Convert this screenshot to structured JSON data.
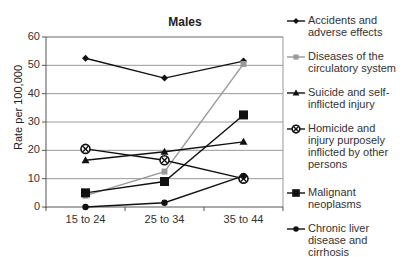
{
  "chart_data": {
    "type": "line",
    "title": "Males",
    "xlabel": "",
    "ylabel": "Rate per 100,000",
    "ylim": [
      0,
      60
    ],
    "yticks": [
      0,
      10,
      20,
      30,
      40,
      50,
      60
    ],
    "grid": true,
    "legend_position": "right",
    "categories": [
      "15 to 24",
      "25 to 34",
      "35 to 44"
    ],
    "series": [
      {
        "name": "Accidents and adverse effects",
        "lines": [
          "Accidents and",
          "adverse effects"
        ],
        "values": [
          52.5,
          45.5,
          51.5
        ],
        "color": "#111111",
        "marker": "diamond"
      },
      {
        "name": "Diseases of the circulatory system",
        "lines": [
          "Diseases of the",
          "circulatory system"
        ],
        "values": [
          4,
          12.5,
          50.5
        ],
        "color": "#999999",
        "marker": "square-small"
      },
      {
        "name": "Suicide and self-inflicted injury",
        "lines": [
          "Suicide and self-",
          "inflicted injury"
        ],
        "values": [
          16.5,
          19.5,
          23
        ],
        "color": "#111111",
        "marker": "triangle"
      },
      {
        "name": "Homicide and injury purposely inflicted by other persons",
        "lines": [
          "Homicide and",
          "injury purposely",
          "inflicted by other",
          "persons"
        ],
        "values": [
          20.5,
          16.5,
          10
        ],
        "color": "#111111",
        "marker": "circle-x"
      },
      {
        "name": "Malignant neoplasms",
        "lines": [
          "Malignant",
          "neoplasms"
        ],
        "values": [
          5,
          9,
          32.5
        ],
        "color": "#111111",
        "marker": "square"
      },
      {
        "name": "Chronic liver disease and cirrhosis",
        "lines": [
          "Chronic liver",
          "disease and",
          "cirrhosis"
        ],
        "values": [
          0,
          1.5,
          11
        ],
        "color": "#111111",
        "marker": "circle"
      }
    ]
  }
}
